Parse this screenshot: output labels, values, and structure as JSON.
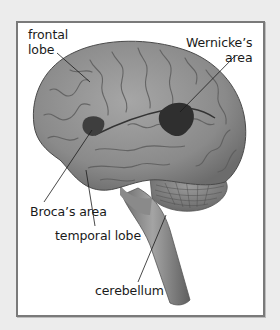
{
  "figure": {
    "type": "labeled-anatomy-diagram",
    "colors": {
      "background": "#ececec",
      "panel": "#ffffff",
      "border": "#7a7a7a",
      "brain": "#8c8c8c",
      "highlight_areas": "#3a3a3a",
      "label_text": "#1a1a1a"
    },
    "labels": [
      {
        "id": "frontal-lobe",
        "lines": [
          "frontal",
          "lobe"
        ]
      },
      {
        "id": "wernickes-area",
        "lines": [
          "Wernicke’s",
          "area"
        ]
      },
      {
        "id": "brocas-area",
        "lines": [
          "Broca’s area"
        ]
      },
      {
        "id": "temporal-lobe",
        "lines": [
          "temporal lobe"
        ]
      },
      {
        "id": "cerebellum",
        "lines": [
          "cerebellum"
        ]
      }
    ]
  }
}
